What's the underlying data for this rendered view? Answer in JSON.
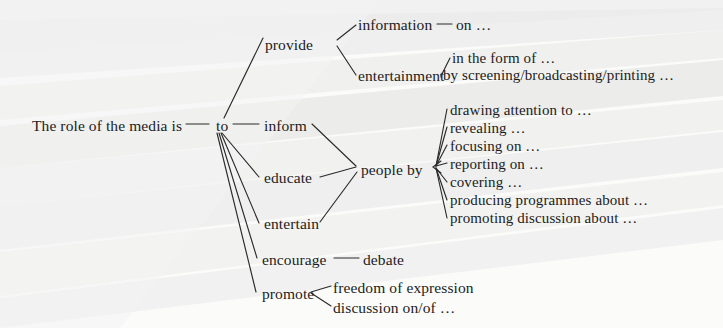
{
  "diagram": {
    "root": {
      "label": "The role of the media is",
      "x": 32,
      "y": 128
    },
    "hub": {
      "label": "to",
      "x": 216,
      "y": 128
    },
    "branches": [
      {
        "id": "provide",
        "label": "provide",
        "x": 265,
        "y": 47
      },
      {
        "id": "inform",
        "label": "inform",
        "x": 264,
        "y": 128
      },
      {
        "id": "educate",
        "label": "educate",
        "x": 264,
        "y": 180
      },
      {
        "id": "entertain",
        "label": "entertain",
        "x": 264,
        "y": 226
      },
      {
        "id": "encourage",
        "label": "encourage",
        "x": 262,
        "y": 262
      },
      {
        "id": "promote",
        "label": "promote",
        "x": 262,
        "y": 296
      }
    ],
    "provide_children": [
      {
        "label": "information",
        "x": 358,
        "y": 28,
        "dash": "—",
        "tail": "on …"
      },
      {
        "label": "entertainment",
        "x": 358,
        "y": 78
      }
    ],
    "entertainment_children": [
      {
        "label": "in the form of …",
        "x": 452,
        "y": 61
      },
      {
        "label": "by screening/broadcasting/printing …",
        "x": 443,
        "y": 78
      }
    ],
    "people_by": {
      "label": "people by",
      "x": 361,
      "y": 172
    },
    "people_by_children": [
      {
        "label": "drawing attention to …",
        "x": 450,
        "y": 113
      },
      {
        "label": "revealing …",
        "x": 450,
        "y": 131
      },
      {
        "label": "focusing on …",
        "x": 450,
        "y": 149
      },
      {
        "label": "reporting on …",
        "x": 450,
        "y": 167
      },
      {
        "label": "covering …",
        "x": 450,
        "y": 185
      },
      {
        "label": "producing programmes about …",
        "x": 450,
        "y": 203
      },
      {
        "label": "promoting discussion about …",
        "x": 450,
        "y": 221
      }
    ],
    "encourage_children": [
      {
        "label": "debate",
        "x": 363,
        "y": 262
      }
    ],
    "promote_children": [
      {
        "label": "freedom of expression",
        "x": 333,
        "y": 290
      },
      {
        "label": "discussion on/of …",
        "x": 333,
        "y": 310
      }
    ],
    "colors": {
      "ink": "#1c1c1c",
      "line": "#2b2b2b",
      "paper": "#fbfbfa",
      "band": "#e6e7e6"
    }
  }
}
